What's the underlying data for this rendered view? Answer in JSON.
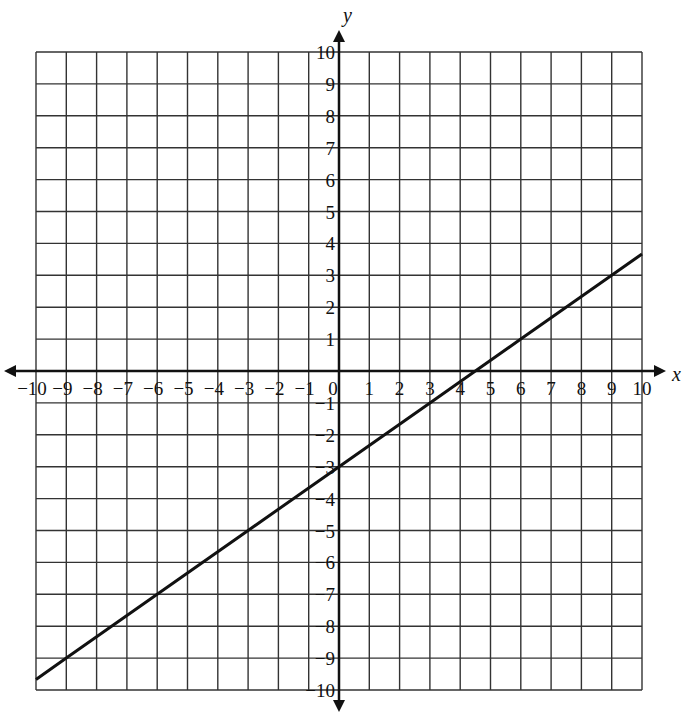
{
  "chart_data": {
    "type": "line",
    "title": "",
    "xlabel": "x",
    "ylabel": "y",
    "xlim": [
      -10,
      10
    ],
    "ylim": [
      -10,
      10
    ],
    "grid": true,
    "x_ticks": [
      -10,
      -9,
      -8,
      -7,
      -6,
      -5,
      -4,
      -3,
      -2,
      -1,
      0,
      1,
      2,
      3,
      4,
      5,
      6,
      7,
      8,
      9,
      10
    ],
    "y_ticks": [
      -10,
      -9,
      -8,
      -7,
      -6,
      -5,
      -4,
      -3,
      -2,
      -1,
      1,
      2,
      3,
      4,
      5,
      6,
      7,
      8,
      9,
      10
    ],
    "series": [
      {
        "name": "line",
        "equation": "y = (2/3)x - 3",
        "slope": 0.6667,
        "intercept": -3,
        "x": [
          -10,
          -9,
          -6,
          -3,
          0,
          3,
          4.5,
          6,
          9,
          10
        ],
        "y": [
          -9.67,
          -9,
          -7,
          -5,
          -3,
          -1,
          0,
          1,
          3,
          3.67
        ]
      }
    ],
    "legend": null
  },
  "axes": {
    "x_label": "x",
    "y_label": "y",
    "origin_label": "0"
  },
  "style": {
    "line_color": "#111111",
    "grid_color": "#333333",
    "background": "#ffffff"
  }
}
